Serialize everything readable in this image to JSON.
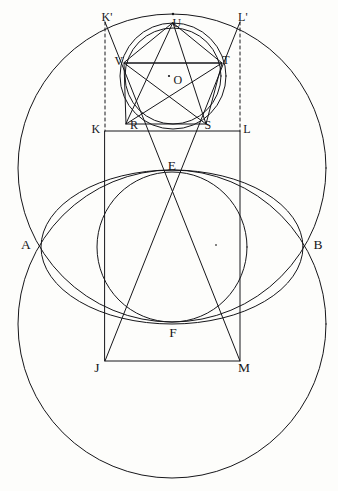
{
  "figure": {
    "background_color": "#fdfdfb",
    "ink_color": "#16161a",
    "stroke_width": 1.0,
    "canvas": {
      "width": 338,
      "height": 491
    }
  },
  "labels": [
    {
      "id": "K-prime",
      "text": "K'",
      "x": 107,
      "y": 17
    },
    {
      "id": "U",
      "text": "U",
      "x": 177,
      "y": 23
    },
    {
      "id": "L-prime",
      "text": "L'",
      "x": 243,
      "y": 17
    },
    {
      "id": "V",
      "text": "V",
      "x": 119,
      "y": 61
    },
    {
      "id": "T",
      "text": "T",
      "x": 226,
      "y": 60
    },
    {
      "id": "O",
      "text": "O",
      "x": 178,
      "y": 80
    },
    {
      "id": "K",
      "text": "K",
      "x": 96,
      "y": 129
    },
    {
      "id": "R",
      "text": "R",
      "x": 134,
      "y": 125
    },
    {
      "id": "S",
      "text": "S",
      "x": 208,
      "y": 125
    },
    {
      "id": "L",
      "text": "L",
      "x": 247,
      "y": 129
    },
    {
      "id": "E",
      "text": "E",
      "x": 172,
      "y": 166
    },
    {
      "id": "A",
      "text": "A",
      "x": 26,
      "y": 245
    },
    {
      "id": "B",
      "text": "B",
      "x": 318,
      "y": 245
    },
    {
      "id": "F",
      "text": "F",
      "x": 173,
      "y": 333
    },
    {
      "id": "J",
      "text": "J",
      "x": 97,
      "y": 368
    },
    {
      "id": "M",
      "text": "M",
      "x": 244,
      "y": 368
    }
  ],
  "points": {
    "U": {
      "x": 173,
      "y": 23
    },
    "V": {
      "x": 124,
      "y": 63
    },
    "T": {
      "x": 222,
      "y": 63
    },
    "R": {
      "x": 126,
      "y": 124
    },
    "S": {
      "x": 206,
      "y": 124
    },
    "O": {
      "x": 173,
      "y": 76
    },
    "K": {
      "x": 105,
      "y": 131
    },
    "L": {
      "x": 240,
      "y": 131
    },
    "Kp": {
      "x": 105,
      "y": 22
    },
    "Lp": {
      "x": 240,
      "y": 22
    },
    "J": {
      "x": 105,
      "y": 361
    },
    "M": {
      "x": 240,
      "y": 361
    },
    "E": {
      "x": 172,
      "y": 172
    },
    "F": {
      "x": 172,
      "y": 322
    },
    "A": {
      "x": 42,
      "y": 248
    },
    "B": {
      "x": 303,
      "y": 248
    },
    "center_dot": {
      "x": 216,
      "y": 245
    }
  },
  "circles": [
    {
      "id": "upper-large-circle",
      "cx": 172,
      "cy": 168,
      "r": 154
    },
    {
      "id": "lower-large-circle",
      "cx": 172,
      "cy": 324,
      "r": 154
    },
    {
      "id": "middle-circle",
      "cx": 172,
      "cy": 247,
      "r": 75
    },
    {
      "id": "pentagon-circumcircle",
      "cx": 173,
      "cy": 76,
      "r": 53
    },
    {
      "id": "pentagon-incircle",
      "cx": 173,
      "cy": 76,
      "r": 48
    }
  ],
  "ellipse": {
    "id": "vesica-ellipse",
    "cx": 172,
    "cy": 247,
    "rx": 131,
    "ry": 77
  },
  "polygons": {
    "pentagon": [
      "U",
      "T",
      "S",
      "R",
      "V"
    ],
    "pentagram": [
      "U",
      "S",
      "V",
      "T",
      "R"
    ],
    "rectangle": [
      "K",
      "L",
      "M",
      "J"
    ]
  },
  "lines": [
    {
      "id": "chord-VT",
      "from": "V",
      "to": "T"
    },
    {
      "id": "diagonal-K-M",
      "from": "Kp",
      "to": "M"
    },
    {
      "id": "diagonal-L-J",
      "from": "Lp",
      "to": "J"
    }
  ],
  "dashed_lines": [
    {
      "id": "dashed-left-KprimeK",
      "x": 105,
      "y1": 22,
      "y2": 131
    },
    {
      "id": "dashed-right-LprimeL",
      "x": 240,
      "y1": 22,
      "y2": 131
    }
  ]
}
